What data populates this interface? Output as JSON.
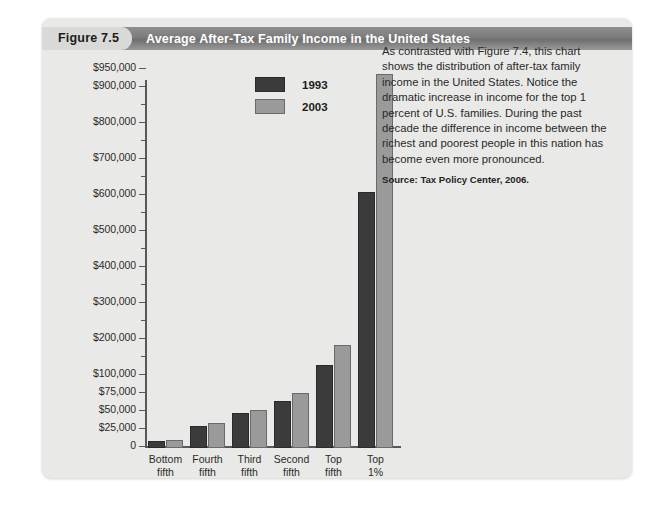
{
  "figure": {
    "tab_label": "Figure 7.5",
    "title": "Average After-Tax Family Income in the United States"
  },
  "caption": {
    "body": "As contrasted with Figure 7.4, this chart shows the distribution of after-tax family income in the United States. Notice the dramatic increase in income for the top 1 percent of U.S. families. During the past decade the difference in income between the richest and poorest people in this nation has become even more pronounced.",
    "source": "Source: Tax Policy Center, 2006."
  },
  "colors": {
    "series_1993": "#3b3b3b",
    "series_2003": "#9a9a9a",
    "panel_background": "#e9e9e7",
    "header_band": "#7c7c7c",
    "axis": "#58585a"
  },
  "chart_data": {
    "type": "bar",
    "title": "Average After-Tax Family Income in the United States",
    "xlabel": "Income percentiles",
    "ylabel": "",
    "grid": false,
    "legend_position": "top-center",
    "note": "Y axis uses a broken (non-linear) scale: $25,000 increments from $0 to $100,000, then $100,000 increments from $100,000 to $900,000, with a final tick at $950,000.",
    "categories": [
      "Bottom fifth",
      "Fourth fifth",
      "Third fifth",
      "Second fifth",
      "Top fifth",
      "Top 1%"
    ],
    "category_lines": [
      [
        "Bottom",
        "fifth"
      ],
      [
        "Fourth",
        "fifth"
      ],
      [
        "Third",
        "fifth"
      ],
      [
        "Second",
        "fifth"
      ],
      [
        "Top",
        "fifth"
      ],
      [
        "Top",
        "1%"
      ]
    ],
    "series": [
      {
        "name": "1993",
        "color": "#3b3b3b",
        "values": [
          10000,
          31000,
          48000,
          65000,
          130000,
          610000
        ]
      },
      {
        "name": "2003",
        "color": "#9a9a9a",
        "values": [
          11000,
          35000,
          53000,
          77000,
          185000,
          940000
        ]
      }
    ],
    "ylim": [
      0,
      950000
    ],
    "ytick_values": [
      0,
      25000,
      50000,
      75000,
      100000,
      200000,
      300000,
      400000,
      500000,
      600000,
      700000,
      800000,
      900000,
      950000
    ],
    "ytick_labels": [
      "0",
      "$25,000",
      "$50,000",
      "$75,000",
      "$100,000",
      "$200,000",
      "$300,000",
      "$400,000",
      "$500,000",
      "$600,000",
      "$700,000",
      "$800,000",
      "$900,000",
      "$950,000"
    ],
    "minor_tick_values": [
      150000,
      250000,
      350000,
      450000,
      550000,
      650000,
      750000,
      850000
    ]
  }
}
